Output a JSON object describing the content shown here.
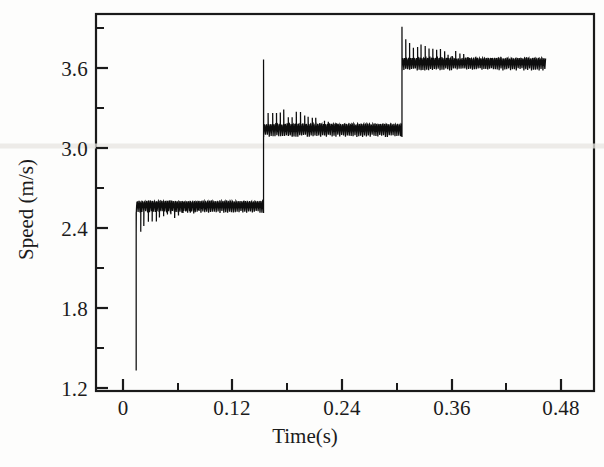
{
  "figure": {
    "background_color": "#fdfdfc",
    "axis_color": "#1a1a1a",
    "trace_color": "#0d0d0d"
  },
  "axes": {
    "y_title": "Speed (m/s)",
    "x_title": "Time(s)",
    "y_ticks": [
      "1.2",
      "1.8",
      "2.4",
      "3.0",
      "3.6"
    ],
    "x_ticks": [
      "0",
      "0.12",
      "0.24",
      "0.36",
      "0.48"
    ]
  },
  "chart_data": {
    "type": "line",
    "title": "",
    "subtitle": "",
    "xlabel": "Time(s)",
    "ylabel": "Speed (m/s)",
    "xlim": [
      -0.0335,
      0.5155
    ],
    "ylim": [
      1.2,
      3.9525
    ],
    "xticks": [
      0,
      0.12,
      0.24,
      0.36,
      0.48
    ],
    "xticklabels": [
      "0",
      "0.12",
      "0.24",
      "0.36",
      "0.48"
    ],
    "yticks": [
      1.2,
      1.8,
      2.4,
      3.0,
      3.6
    ],
    "yticklabels": [
      "1.2",
      "1.8",
      "2.4",
      "3.0",
      "3.6"
    ],
    "minor_ticks": true,
    "grid": false,
    "legend": null,
    "frame": "box",
    "series": [
      {
        "name": "Measured motor speed",
        "description": "Stepwise speed reference tracking with high-frequency measurement ripple and periodic downward/upward sampling spikes",
        "start_time": 0.0108,
        "start_value": 1.35,
        "end_time": 0.4625,
        "segments": [
          {
            "index": 1,
            "t_start": 0.0108,
            "t_end": 0.1512,
            "mean_speed": 2.555,
            "ripple_low": 2.5,
            "ripple_high": 2.61,
            "spike_direction": "down",
            "spike_min": 2.33,
            "spike_decay": "amplitude decreases with time"
          },
          {
            "index": 2,
            "t_start": 0.1512,
            "t_end": 0.3038,
            "mean_speed": 3.12,
            "ripple_low": 3.055,
            "ripple_high": 3.175,
            "spike_direction": "up",
            "spike_max": 3.33,
            "overshoot_peak": 3.62,
            "spike_decay": "amplitude decreases with time"
          },
          {
            "index": 3,
            "t_start": 0.3038,
            "t_end": 0.4625,
            "mean_speed": 3.595,
            "ripple_low": 3.54,
            "ripple_high": 3.655,
            "spike_direction": "up",
            "spike_max": 3.8,
            "overshoot_peak": 3.86,
            "spike_decay": "amplitude decreases with time"
          }
        ],
        "step_levels": [
          2.555,
          3.12,
          3.595
        ],
        "step_times": [
          0.0108,
          0.1512,
          0.3038
        ]
      }
    ]
  }
}
